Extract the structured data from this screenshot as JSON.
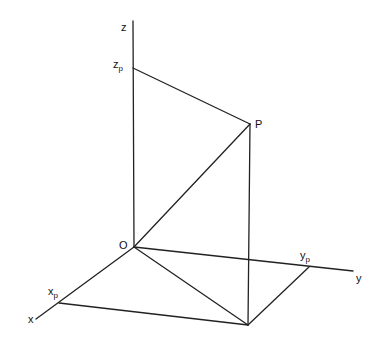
{
  "diagram": {
    "title": "",
    "labels": {
      "z_axis": "z",
      "y_axis": "y",
      "x_axis": "x",
      "origin": "O",
      "point": "P",
      "zp_main": "z",
      "zp_sub": "p",
      "yp_main": "y",
      "yp_sub": "p",
      "xp_main": "x",
      "xp_sub": "p"
    },
    "points": {
      "O": [
        134,
        247
      ],
      "P": [
        250,
        124
      ],
      "z_end": [
        133,
        21
      ],
      "zp": [
        133,
        68
      ],
      "y_end": [
        353,
        271
      ],
      "yp": [
        309,
        267
      ],
      "x_end": [
        36,
        319
      ],
      "xp": [
        59,
        303
      ],
      "Q": [
        248,
        325
      ]
    },
    "edges": [
      [
        "O",
        "z_end"
      ],
      [
        "O",
        "y_end"
      ],
      [
        "O",
        "x_end"
      ],
      [
        "zp",
        "P"
      ],
      [
        "O",
        "P"
      ],
      [
        "P",
        "Q"
      ],
      [
        "O",
        "Q"
      ],
      [
        "xp",
        "Q"
      ],
      [
        "yp",
        "Q"
      ]
    ]
  }
}
